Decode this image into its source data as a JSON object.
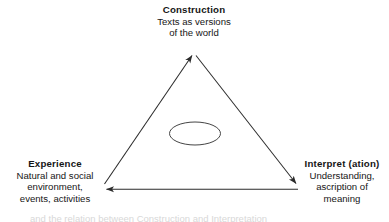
{
  "diagram": {
    "background_color": "#ffffff",
    "line_color": "#2b2b2b",
    "text_color": "#161616",
    "nodes": {
      "construction": {
        "title": "Construction",
        "line1": "Texts as versions",
        "line2": "of the world"
      },
      "experience": {
        "title": "Experience",
        "line1": "Natural and social",
        "line2": "environment,",
        "line3": "events, activities"
      },
      "interpret": {
        "title": "Interpret (ation)",
        "line1": "Understanding,",
        "line2": "ascription of",
        "line3": "meaning"
      }
    },
    "edges": [
      {
        "name": "experience-to-construction",
        "from": "experience",
        "to": "construction",
        "arrow": "to"
      },
      {
        "name": "construction-to-interpret",
        "from": "construction",
        "to": "interpret",
        "arrow": "to"
      },
      {
        "name": "interpret-to-experience",
        "from": "interpret",
        "to": "experience",
        "arrow": "to"
      }
    ],
    "center_shape": {
      "name": "center-ellipse",
      "shape": "ellipse",
      "filled": false
    },
    "caption_partial": "and the relation between Construction and Interpretation"
  }
}
